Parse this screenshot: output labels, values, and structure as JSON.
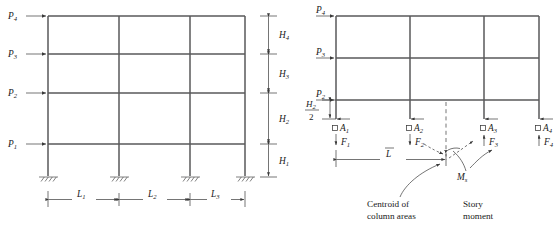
{
  "figure": {
    "title": "",
    "colors": {
      "member": "#58585a",
      "line": "#3a3a3a",
      "text": "#1a1a1a",
      "background": "#ffffff"
    }
  },
  "left_frame": {
    "name": "multistory-frame-elevation",
    "lateral_loads": [
      {
        "label": "P",
        "subscript": "4",
        "level": 4,
        "direction": "right"
      },
      {
        "label": "P",
        "subscript": "3",
        "level": 3,
        "direction": "right"
      },
      {
        "label": "P",
        "subscript": "2",
        "level": 2,
        "direction": "right"
      },
      {
        "label": "P",
        "subscript": "1",
        "level": 1,
        "direction": "right"
      }
    ],
    "story_heights": [
      {
        "label": "H",
        "subscript": "4",
        "story": 4
      },
      {
        "label": "H",
        "subscript": "3",
        "story": 3
      },
      {
        "label": "H",
        "subscript": "2",
        "story": 2
      },
      {
        "label": "H",
        "subscript": "1",
        "story": 1
      }
    ],
    "bay_widths": [
      {
        "label": "L",
        "subscript": "1",
        "bay": 1
      },
      {
        "label": "L",
        "subscript": "2",
        "bay": 2
      },
      {
        "label": "L",
        "subscript": "3",
        "bay": 3
      }
    ],
    "support_type": "fixed",
    "support_count": 4,
    "column_count": 4,
    "beam_count": 4
  },
  "right_frame": {
    "name": "free-body-lower-story",
    "lateral_loads": [
      {
        "label": "P",
        "subscript": "4",
        "level": 4,
        "direction": "right"
      },
      {
        "label": "P",
        "subscript": "3",
        "level": 3,
        "direction": "right"
      },
      {
        "label": "P",
        "subscript": "2",
        "level": 2,
        "direction": "right"
      }
    ],
    "cut_height": {
      "numerator": "H",
      "numerator_subscript": "2",
      "denominator": "2"
    },
    "column_areas": [
      {
        "label": "A",
        "subscript": "1",
        "marker": "square"
      },
      {
        "label": "A",
        "subscript": "2",
        "marker": "square"
      },
      {
        "label": "A",
        "subscript": "3",
        "marker": "square"
      },
      {
        "label": "A",
        "subscript": "4",
        "marker": "square"
      }
    ],
    "axial_forces": [
      {
        "label": "F",
        "subscript": "1",
        "direction": "down"
      },
      {
        "label": "F",
        "subscript": "2",
        "direction": "down"
      },
      {
        "label": "F",
        "subscript": "3",
        "direction": "up"
      },
      {
        "label": "F",
        "subscript": "4",
        "direction": "up"
      }
    ],
    "centroid_dimension": {
      "label": "L",
      "overbar": true
    },
    "story_moment_symbol": {
      "label": "M",
      "subscript": "s"
    },
    "annotations": [
      {
        "name": "centroid-annotation",
        "line1": "Centroid of",
        "line2": "column areas"
      },
      {
        "name": "story-moment-annotation",
        "line1": "Story",
        "line2": "moment"
      }
    ]
  }
}
